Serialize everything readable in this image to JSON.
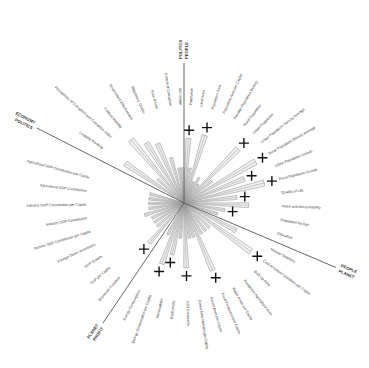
{
  "chart_data": {
    "type": "radial",
    "title": "",
    "center": [
      184,
      203
    ],
    "sections": [
      {
        "name": "POLITICS",
        "divider_label_a": "POLITICS",
        "divider_label_b": "PEOPLE"
      },
      {
        "name": "PEOPLE",
        "divider_label_a": "PEOPLE",
        "divider_label_b": "PLANET"
      },
      {
        "name": "PLANET",
        "divider_label_a": "PLANET",
        "divider_label_b": "PROFIT"
      },
      {
        "name": "PROFIT",
        "divider_label_a": "ECONOMY",
        "divider_label_b": "POLITICS"
      }
    ],
    "dividers": [
      {
        "angle_deg": -90,
        "length": 140,
        "labels": [
          "POLITICS",
          "PEOPLE"
        ]
      },
      {
        "angle_deg": 23,
        "length": 165,
        "labels": [
          "PEOPLE",
          "PLANET"
        ]
      },
      {
        "angle_deg": 124,
        "length": 145,
        "labels": [
          "PLANET",
          "PROFIT"
        ]
      },
      {
        "angle_deg": 207,
        "length": 165,
        "labels": [
          "ECONOMY",
          "POLITICS"
        ]
      }
    ],
    "axes": [
      {
        "label": "Population",
        "angle": -86,
        "value": 0.55,
        "marker": true
      },
      {
        "label": "Land Area",
        "angle": -80,
        "value": 0.3,
        "marker": false
      },
      {
        "label": "Population Area",
        "angle": -73,
        "value": 0.6,
        "marker": true
      },
      {
        "label": "Population Area per Capita",
        "angle": -66,
        "value": 0.2,
        "marker": false
      },
      {
        "label": "Average Population Density",
        "angle": -59,
        "value": 0.25,
        "marker": false
      },
      {
        "label": "Rural Population",
        "angle": -52,
        "value": 0.2,
        "marker": false
      },
      {
        "label": "Urban Population",
        "angle": -45,
        "value": 0.65,
        "marker": true
      },
      {
        "label": "Urban Population Density Average",
        "angle": -38,
        "value": 0.3,
        "marker": false
      },
      {
        "label": "Rural Population Density Average",
        "angle": -30,
        "value": 0.7,
        "marker": true
      },
      {
        "label": "Urban Population Growth",
        "angle": -22,
        "value": 0.55,
        "marker": true
      },
      {
        "label": "Rural Population Growth",
        "angle": -14,
        "value": 0.7,
        "marker": true
      },
      {
        "label": "Quality of Life",
        "angle": -6,
        "value": 0.45,
        "marker": true
      },
      {
        "label": "Voice and Accountability",
        "angle": 2,
        "value": 0.55,
        "marker": false
      },
      {
        "label": "Population by Age",
        "angle": 10,
        "value": 0.35,
        "marker": true
      },
      {
        "label": "Education",
        "angle": 18,
        "value": 0.3,
        "marker": false
      },
      {
        "label": "Natural Disasters",
        "angle": 28,
        "value": 0.5,
        "marker": false
      },
      {
        "label": "Cost of Natural Disasters per Capita",
        "angle": 36,
        "value": 0.7,
        "marker": true
      },
      {
        "label": "Built Up Area",
        "angle": 44,
        "value": 0.3,
        "marker": false
      },
      {
        "label": "Productive Agricultural Area",
        "angle": 52,
        "value": 0.3,
        "marker": false
      },
      {
        "label": "Water Areas per Capita",
        "angle": 60,
        "value": 0.3,
        "marker": false
      },
      {
        "label": "Food Production per Capita",
        "angle": 67,
        "value": 0.62,
        "marker": true
      },
      {
        "label": "Forest Area per Capita",
        "angle": 74,
        "value": 0.3,
        "marker": false
      },
      {
        "label": "Forest Area Needed per Capita",
        "angle": 81,
        "value": 0.3,
        "marker": false
      },
      {
        "label": "CO2 Emissions",
        "angle": 88,
        "value": 0.55,
        "marker": true
      },
      {
        "label": "Biodiversity",
        "angle": 96,
        "value": 0.3,
        "marker": false
      },
      {
        "label": "Renewables",
        "angle": 103,
        "value": 0.45,
        "marker": true
      },
      {
        "label": "Energy Consumption per Capita",
        "angle": 110,
        "value": 0.55,
        "marker": true
      },
      {
        "label": "Energy Consumption",
        "angle": 117,
        "value": 0.3,
        "marker": false
      },
      {
        "label": "Economic Freedom",
        "angle": 131,
        "value": 0.45,
        "marker": true
      },
      {
        "label": "GDP per Capita",
        "angle": 139,
        "value": 0.3,
        "marker": false
      },
      {
        "label": "GDP Growth",
        "angle": 147,
        "value": 0.3,
        "marker": false
      },
      {
        "label": "Foreign Direct Investment",
        "angle": 155,
        "value": 0.3,
        "marker": false
      },
      {
        "label": "Service GDP Contribution per Capita",
        "angle": 163,
        "value": 0.35,
        "marker": false
      },
      {
        "label": "Industry GDP Contribution",
        "angle": 171,
        "value": 0.3,
        "marker": false
      },
      {
        "label": "Industry GDP Contribution per Capita",
        "angle": 179,
        "value": 0.3,
        "marker": false
      },
      {
        "label": "Agricultural GDP Contribution",
        "angle": 187,
        "value": 0.3,
        "marker": false
      },
      {
        "label": "Agricultural GDP Contribution per Capita",
        "angle": 195,
        "value": 0.3,
        "marker": false
      },
      {
        "label": "Livability Ranking",
        "angle": 214,
        "value": 0.6,
        "marker": false
      },
      {
        "label": "Perceptions of Corruption and Corruption Index",
        "angle": 222,
        "value": 0.3,
        "marker": false
      },
      {
        "label": "Political Stability",
        "angle": 230,
        "value": 0.7,
        "marker": false
      },
      {
        "label": "Government Effectiveness",
        "angle": 238,
        "value": 0.6,
        "marker": false
      },
      {
        "label": "Regulatory Quality",
        "angle": 246,
        "value": 0.55,
        "marker": false
      },
      {
        "label": "Rule of Law",
        "angle": 254,
        "value": 0.4,
        "marker": false
      },
      {
        "label": "Control of Corruption",
        "angle": 262,
        "value": 0.3,
        "marker": false
      },
      {
        "label": "Soil Usage",
        "angle": 268,
        "value": 0.3,
        "marker": false
      }
    ],
    "colors": {
      "line": "#999999",
      "fill": "#e6e6e6",
      "divider": "#555555",
      "marker": "#111111",
      "text": "#333333"
    }
  }
}
